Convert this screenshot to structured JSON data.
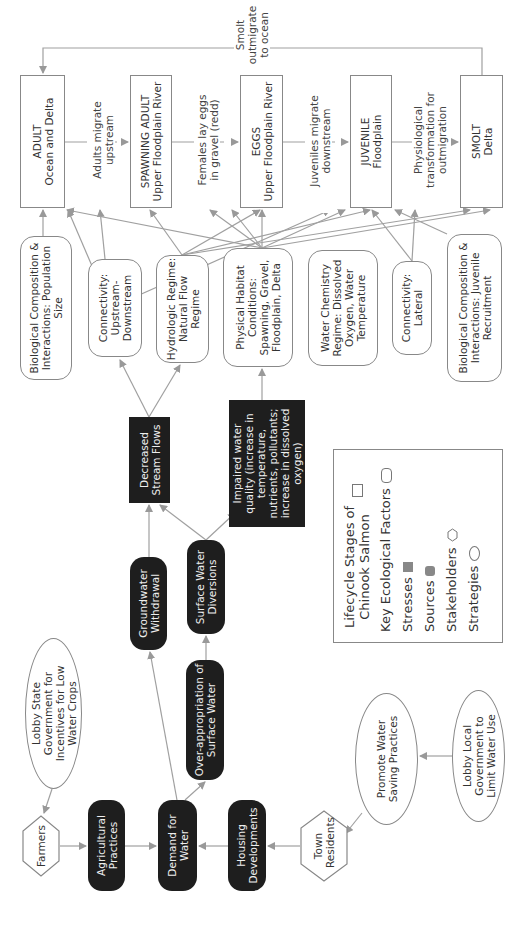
{
  "lifecycle": {
    "adult": {
      "title": "ADULT",
      "place": "Ocean and Delta"
    },
    "spawning": {
      "title": "SPAWNING ADULT",
      "place": "Upper Floodplain River"
    },
    "eggs": {
      "title": "EGGS",
      "place": "Upper Floodplain River"
    },
    "juvenile": {
      "title": "JUVENILE",
      "place": "Floodplain"
    },
    "smolt": {
      "title": "SMOLT",
      "place": "Delta"
    }
  },
  "transitions": {
    "t1": "Adults migrate upstream",
    "t2": "Females lay eggs in gravel (redd)",
    "t3": "Juveniles migrate downstream",
    "t4": "Physiological transformation for outmigration",
    "t5": "Smolt outmigrate to ocean"
  },
  "factors": {
    "bio_pop": "Biological Composition & Interactions: Population Size",
    "conn_ud": "Connectivity: Upstream-Downstream",
    "hydro": "Hydrologic Regime: Natural Flow Regime",
    "physical": "Physical Habitat Conditions: Spawning, Gravel, Floodplain, Delta",
    "water_chem": "Water Chemistry Regime: Dissolved Oxygen, Water Temperature",
    "conn_lat": "Connectivity: Lateral",
    "bio_juv": "Biological Composition & Interactions: Juvenile Recruitment"
  },
  "stresses": {
    "decreased_flows": "Decreased Stream Flows",
    "impaired_quality": "Impaired water quality (increase in temperature, nutrients, pollutants; increase in dissolved oxygen)"
  },
  "sources": {
    "groundwater": "Groundwater Withdrawal",
    "surface_div": "Surface Water Diversions",
    "over_app": "Over-appropriation of Surface Water",
    "agri": "Agricultural Practices",
    "demand": "Demand for Water",
    "housing": "Housing Developments"
  },
  "stakeholders": {
    "farmers": "Farmers",
    "town": "Town Residents"
  },
  "strategies": {
    "lobby_state": "Lobby State Government for Incentives for Low Water Crops",
    "promote": "Promote Water Saving Practices",
    "lobby_local": "Lobby Local Government to Limit Water Use"
  },
  "legend": {
    "lifecycle": "Lifecycle Stages of Chinook Salmon",
    "factors": "Key Ecological Factors",
    "stresses": "Stresses",
    "sources": "Sources",
    "stakeholders": "Stakeholders",
    "strategies": "Strategies"
  },
  "colors": {
    "line": "#999999",
    "dark_fill": "#1e1e1e",
    "border": "#888888"
  }
}
